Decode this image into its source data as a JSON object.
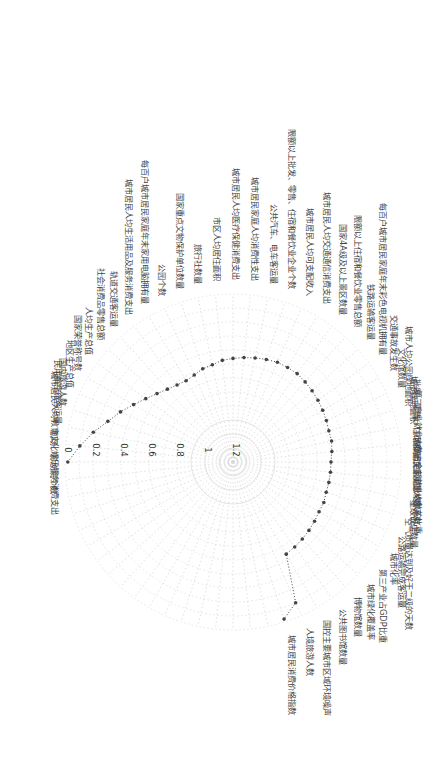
{
  "chart_data": {
    "type": "radar",
    "title": "",
    "orientation": "rotated 90° clockwise (labels read vertically)",
    "radial_axis": {
      "ticks": [
        "0",
        "0.2",
        "0.4",
        "0.6",
        "0.8",
        "1",
        "1.2"
      ],
      "range": [
        0,
        1.2
      ],
      "reversed": true,
      "note": "0 at outer ring, 1.2 at center"
    },
    "grid": true,
    "legend": null,
    "categories": [
      "剧场、影剧院个数",
      "城市居民人均教育文化娱乐服务消费支出",
      "民用航空旅客运量",
      "国内旅游人数",
      "地区生产总值",
      "国家荣誉称号数",
      "人均生产总值",
      "社会消费品零售总额",
      "轨道交通客运量",
      "城市居民人均生活用品及服务消费支出",
      "每百户城市居民家庭年末家用电脑拥有量",
      "公园个数",
      "国家重点文物保护单位数量",
      "旅行社数量",
      "市区人均居住面积",
      "城市居民人均医疗保健消费支出",
      "城市居民家庭人均消费性支出",
      "公共汽车、电车客运量",
      "限额以上批发、零售、住宿和餐饮业企业个数",
      "城市居民人均可支配收入",
      "城市居民人均交通通信消费支出",
      "国家4A级及以上景区数量",
      "限额以上住宿和餐饮业零售总额",
      "铁路运输客运量",
      "每百户城市居民家庭年末彩色电视机拥有量",
      "交通事故发生数",
      "文化馆数量",
      "城市人均公园绿地面积",
      "城市绿地面积",
      "批发、零售、住宿和餐饮业从业人数",
      "第三产业就业人数占全部就业人数的比重",
      "城镇居民家庭恩格尔系数",
      "星级饭店数量",
      "空气质量达到及好于二级的天数",
      "公路运输完成客运量",
      "城市化率",
      "第三产业占GDP比重",
      "城市绿化覆盖率",
      "博物馆数量",
      "公共图书馆数量",
      "国控主要城市区域环境噪声",
      "人境旅游人数",
      "城市居民消费价格指数"
    ],
    "values": [
      0.02,
      0.1,
      0.18,
      0.26,
      0.32,
      0.38,
      0.43,
      0.47,
      0.5,
      0.52,
      0.53,
      0.52,
      0.5,
      0.49,
      0.47,
      0.46,
      0.45,
      0.44,
      0.43,
      0.42,
      0.42,
      0.42,
      0.43,
      0.44,
      0.45,
      0.46,
      0.47,
      0.48,
      0.48,
      0.49,
      0.5,
      0.5,
      0.5,
      0.5,
      0.49,
      0.49,
      0.48,
      0.47,
      0.46,
      0.45,
      0.44,
      0.1,
      0.02
    ],
    "marker": "dot",
    "line_style": "dotted",
    "series_color": "#444444",
    "grid_color": "#d8d8d8"
  }
}
